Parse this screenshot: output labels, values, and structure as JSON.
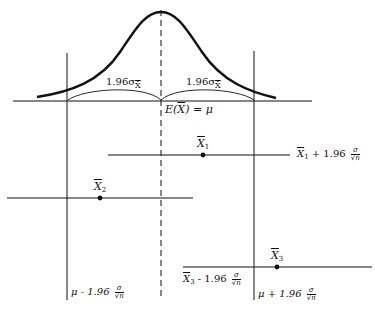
{
  "diagram": {
    "type": "confidence-interval-illustration",
    "curve": {
      "kind": "normal-distribution",
      "center_label": "E(X̄) = μ"
    },
    "half_width_labels": {
      "left": "1.96σ",
      "left_sub": "X̄",
      "right": "1.96σ",
      "right_sub": "X̄"
    },
    "axis_label": {
      "lhs": "E(",
      "var": "X",
      "rhs": ") = μ"
    },
    "bounds": {
      "lower": {
        "prefix": "μ - 1.96",
        "num": "σ",
        "den": "√n"
      },
      "upper": {
        "prefix": "μ + 1.96",
        "num": "σ",
        "den": "√n"
      }
    },
    "samples": [
      {
        "name": "X",
        "index": "1",
        "interval_label": {
          "var": "X",
          "index": "1",
          "op": "+ 1.96",
          "num": "σ",
          "den": "√n"
        }
      },
      {
        "name": "X",
        "index": "2"
      },
      {
        "name": "X",
        "index": "3",
        "interval_label": {
          "var": "X",
          "index": "3",
          "op": "- 1.96",
          "num": "σ",
          "den": "√n"
        }
      }
    ],
    "colors": {
      "ink": "#111111",
      "background": "#ffffff"
    }
  }
}
